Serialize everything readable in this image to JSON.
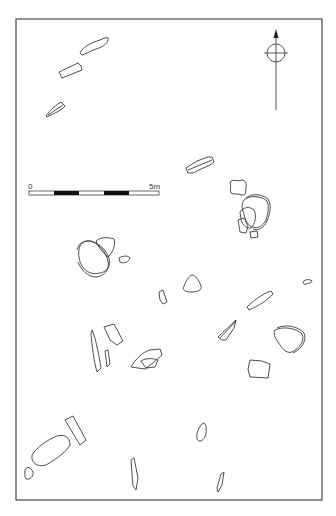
{
  "figure": {
    "type": "archaeological site plan",
    "frame_color": "#555555",
    "stroke_color": "#3a3a3a"
  },
  "scale_bar": {
    "start_label": "0",
    "end_label": "5m",
    "segments": [
      "white",
      "black",
      "white",
      "black",
      "white"
    ]
  },
  "north_arrow": {
    "icon": "north-arrow-icon"
  },
  "stones": [
    {
      "id": 1,
      "area": "north",
      "shape": "elongated"
    },
    {
      "id": 2,
      "area": "north",
      "shape": "rectangular"
    },
    {
      "id": 3,
      "area": "north",
      "shape": "pointed"
    },
    {
      "id": 4,
      "area": "centre-north",
      "shape": "double-outline slab"
    },
    {
      "id": 5,
      "area": "centre-east",
      "shape": "waisted"
    },
    {
      "id": 6,
      "area": "centre-east",
      "shape": "stacked cluster"
    },
    {
      "id": 7,
      "area": "centre-west",
      "shape": "stacked cluster"
    },
    {
      "id": 8,
      "area": "centre",
      "shape": "triangular"
    },
    {
      "id": 9,
      "area": "centre",
      "shape": "small block"
    },
    {
      "id": 10,
      "area": "east",
      "shape": "elongated"
    },
    {
      "id": 11,
      "area": "east",
      "shape": "small hook"
    },
    {
      "id": 12,
      "area": "south-west",
      "shape": "slender"
    },
    {
      "id": 13,
      "area": "south-centre",
      "shape": "collapsed slab"
    },
    {
      "id": 14,
      "area": "south-east",
      "shape": "wedge"
    },
    {
      "id": 15,
      "area": "south-east",
      "shape": "rounded double-outline"
    },
    {
      "id": 16,
      "area": "south-east",
      "shape": "square"
    },
    {
      "id": 17,
      "area": "south",
      "shape": "large rectangular"
    },
    {
      "id": 18,
      "area": "south",
      "shape": "small oval"
    },
    {
      "id": 19,
      "area": "south",
      "shape": "slender"
    }
  ]
}
